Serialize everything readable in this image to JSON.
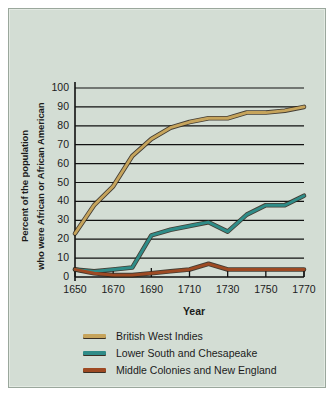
{
  "chart_data": {
    "type": "line",
    "title": "",
    "subtitle": "",
    "xlabel": "Year",
    "ylabel": "Percent of the population who were African or African American",
    "ylabel_line1": "Percent of the population",
    "ylabel_line2": "who were African or African American",
    "xlim": [
      1650,
      1770
    ],
    "ylim": [
      0,
      100
    ],
    "grid": true,
    "legend_position": "bottom-left",
    "xticks": [
      1650,
      1670,
      1690,
      1710,
      1730,
      1750,
      1770
    ],
    "xtick_labels": [
      "1650",
      "1670",
      "1690",
      "1710",
      "1730",
      "1750",
      "1770"
    ],
    "yticks": [
      0,
      10,
      20,
      30,
      40,
      50,
      60,
      70,
      80,
      90,
      100
    ],
    "ytick_labels": [
      "0",
      "10",
      "20",
      "30",
      "40",
      "50",
      "60",
      "70",
      "80",
      "90",
      "100"
    ],
    "x": [
      1650,
      1660,
      1670,
      1680,
      1690,
      1700,
      1710,
      1720,
      1730,
      1740,
      1750,
      1760,
      1770
    ],
    "series": [
      {
        "name": "British West Indies",
        "color": "#c6a45c",
        "values": [
          23,
          38,
          48,
          64,
          73,
          79,
          82,
          84,
          84,
          87,
          87,
          88,
          90
        ]
      },
      {
        "name": "Lower South and Chesapeake",
        "color": "#2f8c88",
        "values": [
          4,
          3,
          4,
          5,
          22,
          25,
          27,
          29,
          24,
          33,
          38,
          38,
          43
        ]
      },
      {
        "name": "Middle Colonies and New England",
        "color": "#9e4a23",
        "values": [
          4,
          2,
          1,
          1,
          2,
          3,
          4,
          7,
          4,
          4,
          4,
          4,
          4
        ]
      }
    ]
  },
  "legend": {
    "items": [
      {
        "label": "British West Indies",
        "color": "#c6a45c"
      },
      {
        "label": "Lower South and Chesapeake",
        "color": "#2f8c88"
      },
      {
        "label": "Middle Colonies and New England",
        "color": "#9e4a23"
      }
    ]
  },
  "axes": {
    "x_title": "Year"
  }
}
